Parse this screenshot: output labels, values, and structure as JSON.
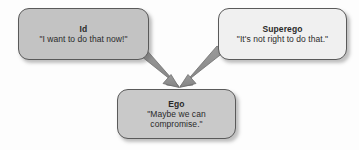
{
  "diagram": {
    "background_color": "#fdfdfd",
    "arrow_color": "#8a8a8a",
    "arrow_outline_color": "#6f6f6f",
    "nodes": [
      {
        "id": "id",
        "title": "Id",
        "quote": "\"I want to do that now!\"",
        "quote_lines": [
          "\"I want to do that now!\""
        ],
        "fill_color": "#c3c3c3",
        "border_color": "#5a5a5a"
      },
      {
        "id": "superego",
        "title": "Superego",
        "quote": "\"It's not right to do that.\"",
        "quote_lines": [
          "\"It's not right to do that.\""
        ],
        "fill_color": "#f0f0f0",
        "border_color": "#5a5a5a"
      },
      {
        "id": "ego",
        "title": "Ego",
        "quote": "\"Maybe we can compromise.\"",
        "quote_lines": [
          "\"Maybe we can",
          "compromise.\""
        ],
        "fill_color": "#c9c9c9",
        "border_color": "#5a5a5a"
      }
    ],
    "edges": [
      {
        "id": "id-to-ego",
        "from": "id",
        "to": "ego",
        "style": "solid-arrow"
      },
      {
        "id": "superego-to-ego",
        "from": "superego",
        "to": "ego",
        "style": "solid-arrow"
      }
    ]
  }
}
